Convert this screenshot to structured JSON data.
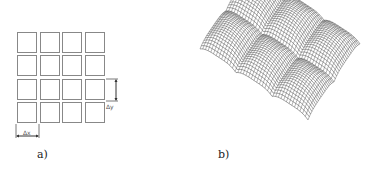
{
  "panels": {
    "a": {
      "label": "a)",
      "grid": {
        "rows": 4,
        "cols": 4,
        "origin_x": 17,
        "origin_y": 32,
        "cell_w": 20,
        "cell_h": 21,
        "pitch_x": 22.7,
        "pitch_y": 23.3
      },
      "dx_label": "Δx",
      "dy_label": "Δy"
    },
    "b": {
      "label": "b)",
      "surface": {
        "description": "3D wireframe mesh surface with 2x3 array of rounded peaks",
        "peaks_rows": 2,
        "peaks_cols": 3,
        "mesh_lines": 40
      }
    }
  },
  "colors": {
    "stroke": "#555555",
    "grid": "#888888",
    "text": "#222222"
  }
}
